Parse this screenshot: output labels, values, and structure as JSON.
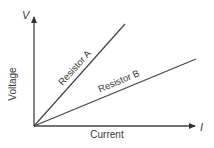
{
  "diagram": {
    "type": "voltage-current graph",
    "y_axis": {
      "symbol": "V",
      "label": "Voltage"
    },
    "x_axis": {
      "symbol": "I",
      "label": "Current"
    },
    "lines": [
      {
        "label": "Resistor A",
        "description": "steeper slope (higher resistance)"
      },
      {
        "label": "Resistor B",
        "description": "shallower slope (lower resistance)"
      }
    ],
    "colors": {
      "line": "#444444",
      "text": "#3a3a3a",
      "background": "#ffffff"
    }
  }
}
